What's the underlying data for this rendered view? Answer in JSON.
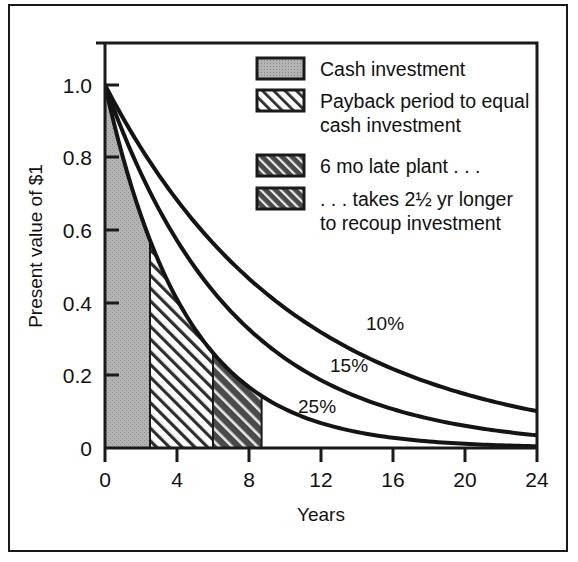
{
  "chart_data": {
    "type": "line",
    "title": "",
    "xlabel": "Years",
    "ylabel": "Present value of $1",
    "xlim": [
      0,
      24
    ],
    "ylim": [
      0,
      1.05
    ],
    "grid": false,
    "legend_position": "top-right",
    "x_ticks": [
      "0",
      "4",
      "8",
      "12",
      "16",
      "20",
      "24"
    ],
    "x_tick_values": [
      0,
      4,
      8,
      12,
      16,
      20,
      24
    ],
    "y_ticks": [
      "0",
      "0.2",
      "0.4",
      "0.6",
      "0.8",
      "1.0"
    ],
    "y_tick_values": [
      0,
      0.2,
      0.4,
      0.6,
      0.8,
      1.0
    ],
    "series": [
      {
        "name": "10%",
        "rate": 0.1,
        "label": "10%",
        "x": [
          0,
          2,
          4,
          6,
          8,
          10,
          12,
          14,
          16,
          18,
          20,
          22,
          24
        ],
        "values": [
          1.0,
          0.826,
          0.683,
          0.564,
          0.467,
          0.386,
          0.319,
          0.263,
          0.218,
          0.18,
          0.149,
          0.123,
          0.102
        ]
      },
      {
        "name": "15%",
        "rate": 0.15,
        "label": "15%",
        "x": [
          0,
          2,
          4,
          6,
          8,
          10,
          12,
          14,
          16,
          18,
          20,
          22,
          24
        ],
        "values": [
          1.0,
          0.756,
          0.572,
          0.432,
          0.327,
          0.247,
          0.187,
          0.141,
          0.107,
          0.081,
          0.061,
          0.046,
          0.035
        ]
      },
      {
        "name": "25%",
        "rate": 0.25,
        "label": "25%",
        "x": [
          0,
          2,
          4,
          6,
          8,
          10,
          12,
          14,
          16,
          18,
          20,
          22,
          24
        ],
        "values": [
          1.0,
          0.64,
          0.41,
          0.262,
          0.168,
          0.107,
          0.069,
          0.044,
          0.028,
          0.018,
          0.012,
          0.007,
          0.004
        ]
      }
    ],
    "regions": [
      {
        "name": "cash-investment",
        "pattern": "solid-gray",
        "x_start": 0,
        "x_end": 2.5,
        "bounded_by": "25%"
      },
      {
        "name": "payback-period",
        "pattern": "light-diagonal-hatch",
        "x_start": 2.5,
        "x_end": 6.0,
        "bounded_by": "25%"
      },
      {
        "name": "late-plant-recoup",
        "pattern": "dark-diagonal-hatch",
        "x_start": 6.0,
        "x_end": 8.7,
        "bounded_by": "25%"
      }
    ],
    "annotations": [
      "10%",
      "15%",
      "25%"
    ]
  },
  "legend": {
    "items": [
      {
        "swatch": "solid-gray",
        "label": "Cash investment"
      },
      {
        "swatch": "light-diagonal-hatch",
        "label_line1": "Payback period to equal",
        "label_line2": "cash investment"
      },
      {
        "swatch": "dark-diagonal-hatch",
        "label": "6 mo late plant . . ."
      },
      {
        "swatch": "dark-diagonal-hatch",
        "label_line1": ". . . takes 2½ yr longer",
        "label_line2": "to recoup investment"
      }
    ]
  },
  "colors": {
    "ink": "#1a1a1a",
    "gray_fill": "#b0b0b0",
    "hatch_dark": "#3a3a3a",
    "hatch_light_bg": "#ffffff",
    "background": "#ffffff"
  }
}
